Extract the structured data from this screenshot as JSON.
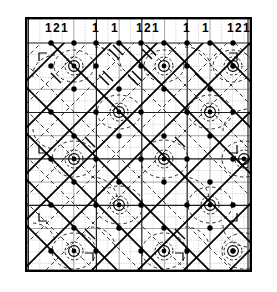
{
  "figure": {
    "kind": "space-group-symmetry-diagram",
    "frame": {
      "x": 25,
      "y": 17,
      "width": 227,
      "height": 255,
      "border_color": "#000000",
      "border_width": 2,
      "background": "#ffffff"
    },
    "grid": {
      "minor_color": "#b9b9b9",
      "major_color": "#1a1a1a",
      "minor_step_x": 11.35,
      "minor_step_y": 11.6,
      "major_columns": 5,
      "major_rows": 5,
      "label_row_height": 24
    },
    "symbols": {
      "mirror_line_color": "#000000",
      "glide_line_color": "#000000",
      "axis_dot_color": "#000000",
      "rosette_color": "#000000"
    },
    "top_labels": [
      {
        "group": "1 2 1",
        "parts": [
          "1",
          "2",
          "1"
        ],
        "column": 1
      },
      {
        "group": "1 1",
        "parts": [
          "1",
          "1"
        ],
        "column": 2
      },
      {
        "group": "1 2 1",
        "parts": [
          "1",
          "2",
          "1"
        ],
        "column": 3
      },
      {
        "group": "1 1",
        "parts": [
          "1",
          "1"
        ],
        "column": 4
      },
      {
        "group": "1 2 1",
        "parts": [
          "1",
          "2",
          "1"
        ],
        "column": 5
      }
    ],
    "label_items": [
      {
        "text": "1",
        "x": 45,
        "y": 22
      },
      {
        "text": "2",
        "x": 53,
        "y": 22
      },
      {
        "text": "1",
        "x": 61,
        "y": 22
      },
      {
        "text": "1",
        "x": 92,
        "y": 22
      },
      {
        "text": "1",
        "x": 111,
        "y": 22
      },
      {
        "text": "1",
        "x": 136,
        "y": 22
      },
      {
        "text": "2",
        "x": 144,
        "y": 22
      },
      {
        "text": "1",
        "x": 152,
        "y": 22
      },
      {
        "text": "1",
        "x": 183,
        "y": 22
      },
      {
        "text": "1",
        "x": 202,
        "y": 22
      },
      {
        "text": "1",
        "x": 227,
        "y": 22
      },
      {
        "text": "2",
        "x": 235,
        "y": 22
      },
      {
        "text": "1",
        "x": 243,
        "y": 22
      }
    ]
  }
}
